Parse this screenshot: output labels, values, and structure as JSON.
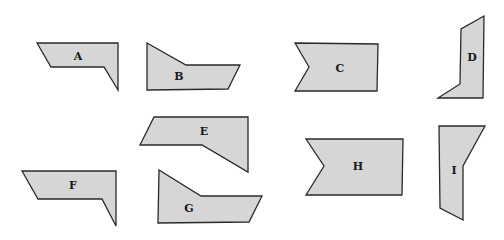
{
  "diagram": {
    "colors": {
      "fill": "#d6d6d6",
      "stroke": "#2a2a2a",
      "background": "#ffffff"
    },
    "shapes": [
      {
        "label": "A",
        "points": "37,43 118,43 118,90 104,67 51,67",
        "label_pos": [
          78,
          56
        ]
      },
      {
        "label": "B",
        "points": "147,43 186,65 240,65 228,89 147,90",
        "label_pos": [
          179,
          76
        ]
      },
      {
        "label": "C",
        "points": "295,43 378,44 377,91 295,91 309,67",
        "label_pos": [
          340,
          68
        ]
      },
      {
        "label": "D",
        "points": "484,16 483,98 438,98 460,84 461,29",
        "label_pos": [
          472,
          57
        ]
      },
      {
        "label": "E",
        "points": "154,117 248,117 248,172 202,145 140,145",
        "label_pos": [
          204,
          131
        ]
      },
      {
        "label": "F",
        "points": "22,171 116,171 116,226 102,199 38,199",
        "label_pos": [
          73,
          185
        ]
      },
      {
        "label": "G",
        "points": "159,170 201,196 262,196 249,222 158,223",
        "label_pos": [
          189,
          208
        ]
      },
      {
        "label": "H",
        "points": "306,139 403,139 402,195 306,195 324,166",
        "label_pos": [
          358,
          166
        ]
      },
      {
        "label": "I",
        "points": "439,126 485,126 463,166 463,220 440,208",
        "label_pos": [
          454,
          170
        ]
      }
    ]
  }
}
